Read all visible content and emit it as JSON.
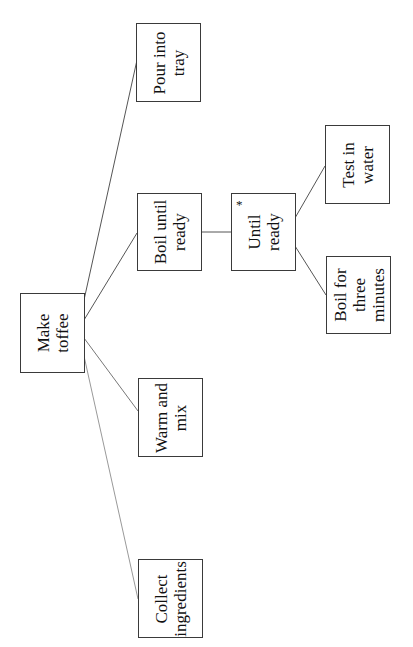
{
  "diagram": {
    "type": "structure-chart",
    "orientation": "rotated-90-ccw",
    "nodes": {
      "root": {
        "label": "Make\ntoffee"
      },
      "collect": {
        "label": "Collect\ningredients"
      },
      "warm": {
        "label": "Warm and\nmix"
      },
      "boil": {
        "label": "Boil until\nready"
      },
      "pour": {
        "label": "Pour into\ntray"
      },
      "until": {
        "label": "Until\nready",
        "marker": "*"
      },
      "boil3": {
        "label": "Boil for\nthree\nminutes"
      },
      "test": {
        "label": "Test in\nwater"
      }
    },
    "edges": [
      [
        "Make toffee",
        "Collect ingredients"
      ],
      [
        "Make toffee",
        "Warm and mix"
      ],
      [
        "Make toffee",
        "Boil until ready"
      ],
      [
        "Make toffee",
        "Pour into tray"
      ],
      [
        "Boil until ready",
        "Until ready"
      ],
      [
        "Until ready",
        "Boil for three minutes"
      ],
      [
        "Until ready",
        "Test in water"
      ]
    ],
    "colors": {
      "line": "#555555",
      "border": "#3a3a3a",
      "text": "#111111",
      "background": "#ffffff"
    }
  }
}
